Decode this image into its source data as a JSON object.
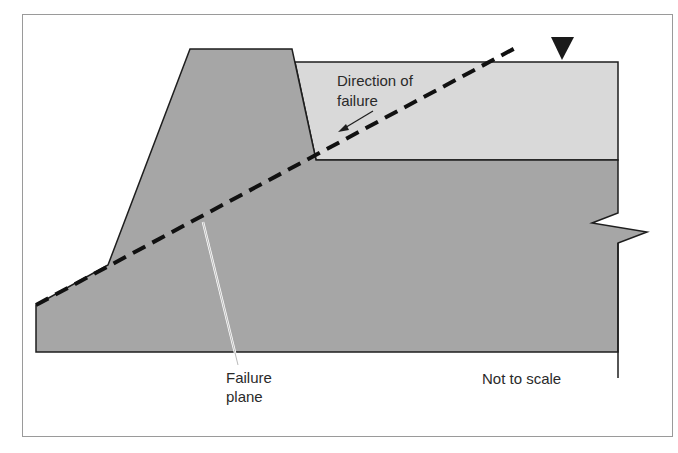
{
  "diagram": {
    "labels": {
      "direction_line1": "Direction of",
      "direction_line2": "failure",
      "failure_line1": "Failure",
      "failure_line2": "plane",
      "scale_note": "Not to scale"
    },
    "elements": {
      "dam_body": "Embankment / dam",
      "reservoir_layer": "Retained material",
      "foundation": "Foundation",
      "water_level_marker": "water-level-triangle-icon",
      "failure_plane": "Dashed failure plane line",
      "direction_arrow": "Arrow indicating direction of failure"
    },
    "colors": {
      "frame": "#9a9a9a",
      "dark_fill": "#a6a6a6",
      "light_fill": "#d9d9d9",
      "outline": "#1e1e1e",
      "dash": "#111111",
      "text": "#2a2a2a"
    }
  }
}
